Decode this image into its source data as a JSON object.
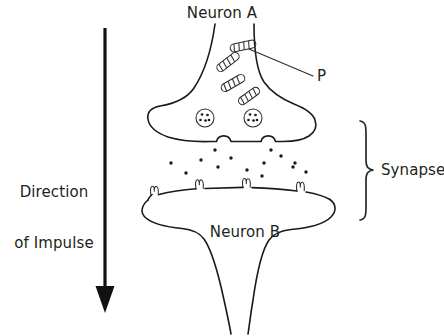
{
  "figure": {
    "kind": "biology-diagram",
    "background_color": "#ffffff",
    "ink_color": "#1a1a1a",
    "text_color": "#231f20",
    "width": 444,
    "height": 336
  },
  "labels": {
    "neuron_a": "Neuron A",
    "neuron_b": "Neuron B",
    "structure_p": "P",
    "synapse": "Synapse",
    "direction_line1": "Direction",
    "direction_line2": "of Impulse"
  },
  "annotations": {
    "leader_line_p": {
      "from_x": 249,
      "from_y": 49,
      "to_x": 313,
      "to_y": 76,
      "points_to": "mitochondrion"
    },
    "synapse_brace": {
      "top_y": 121,
      "bottom_y": 220,
      "tip_x": 377,
      "tip_y": 170,
      "spine_x": 366
    },
    "impulse_arrow": {
      "x": 105,
      "top_y": 28,
      "bottom_y": 312,
      "direction": "downward"
    }
  },
  "structures": {
    "mitochondria_count": 4,
    "mitochondria": [
      {
        "cx": 243,
        "cy": 46,
        "angle": -12,
        "length": 26,
        "thickness": 8
      },
      {
        "cx": 228,
        "cy": 62,
        "angle": -38,
        "length": 26,
        "thickness": 8
      },
      {
        "cx": 233,
        "cy": 83,
        "angle": -30,
        "length": 26,
        "thickness": 8
      },
      {
        "cx": 249,
        "cy": 96,
        "angle": -36,
        "length": 24,
        "thickness": 8
      }
    ],
    "vesicles_count": 2,
    "vesicles": [
      {
        "cx": 205,
        "cy": 118,
        "r": 9,
        "dots": 5
      },
      {
        "cx": 253,
        "cy": 118,
        "r": 9,
        "dots": 5
      }
    ],
    "release_pores_count": 2,
    "release_pores": [
      {
        "cx": 222,
        "cy": 140
      },
      {
        "cx": 268,
        "cy": 140
      }
    ],
    "receptors_count": 4,
    "receptors": [
      {
        "cx": 155,
        "cy": 196
      },
      {
        "cx": 200,
        "cy": 189
      },
      {
        "cx": 247,
        "cy": 188
      },
      {
        "cx": 301,
        "cy": 192
      }
    ],
    "neurotransmitter_count": 14,
    "neurotransmitters": [
      {
        "cx": 215,
        "cy": 150,
        "r": 1.7
      },
      {
        "cx": 271,
        "cy": 150,
        "r": 1.7
      },
      {
        "cx": 231,
        "cy": 158,
        "r": 1.7
      },
      {
        "cx": 281,
        "cy": 156,
        "r": 1.7
      },
      {
        "cx": 201,
        "cy": 160,
        "r": 1.7
      },
      {
        "cx": 264,
        "cy": 163,
        "r": 1.7
      },
      {
        "cx": 171,
        "cy": 163,
        "r": 1.7
      },
      {
        "cx": 295,
        "cy": 163,
        "r": 1.7
      },
      {
        "cx": 218,
        "cy": 167,
        "r": 1.7
      },
      {
        "cx": 247,
        "cy": 170,
        "r": 1.7
      },
      {
        "cx": 186,
        "cy": 173,
        "r": 1.7
      },
      {
        "cx": 293,
        "cy": 167,
        "r": 1.7
      },
      {
        "cx": 262,
        "cy": 176,
        "r": 1.7
      },
      {
        "cx": 306,
        "cy": 172,
        "r": 1.7
      }
    ]
  }
}
